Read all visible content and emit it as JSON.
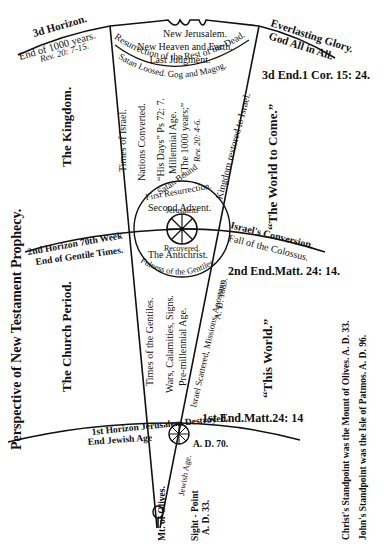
{
  "title": "Perspective of New Testament Prophecy.",
  "side_labels": {
    "kingdom": "The Kingdom.",
    "church_period": "The Church Period.",
    "world_to_come": "“The World to Come.”",
    "this_world": "“This World.”"
  },
  "top": {
    "new_jerusalem": "New Jerusalem.",
    "new_heaven": "New Heaven and Earth.",
    "last_judgment": "Last Judgment.",
    "resurrection": "Resurrection of the Rest of the Dead.",
    "satan_loosed": "Satan Loosed. Gog and Magog."
  },
  "third_horizon": {
    "title": "3d Horizon.",
    "line1": "End of 1000 years.",
    "line2": "Rev. 20: 7-15."
  },
  "everlasting": {
    "line1": "Everlasting Glory.",
    "line2": "God All in All."
  },
  "third_end": "3d End.1 Cor. 15: 24.",
  "kingdom_cone": {
    "times_of_israel": "Times of Israel.",
    "nations_converted": "Nations Converted.",
    "his_days": "“His Days” Ps 72: 7.",
    "millennial_age": "Millennial Age.",
    "thousand_years": "“The 1000 years;”",
    "rev_20": "Rev. 20: 4-6.",
    "kingdom_restored": "Kingdom restored to Israel.",
    "satan_bound": "Satan Bound",
    "first_resurrection": "First Resurrection."
  },
  "center": {
    "second_advent": "Second Advent.",
    "jerusalem": "Jerusalem",
    "recovered": "Recovered.",
    "antichrist": "The Antichrist.",
    "fulness": "Fulness of the Gentiles."
  },
  "second_horizon": {
    "line1": "2nd Horizon 70th Week",
    "line2": "End of Gentile Times."
  },
  "israels_conversion": {
    "line1": "Israel's Conversion.",
    "line2": "Fall of the Colossus."
  },
  "second_end": "2nd End.Matt. 24: 14.",
  "church_cone": {
    "times_of_gentiles": "Times of the Gentiles.",
    "wars": "Wars, Calamities, Signs.",
    "premillennial": "Pre-millennial Age.",
    "israel_scattered": "Israel Scattered, Missions, Apostasy.",
    "ad_1889": "A. D. 1889."
  },
  "first_horizon": {
    "line1": "1st Horizon Jerusalem Destroyed.",
    "line2": "End Jewish Age",
    "ad70": "A. D. 70."
  },
  "first_end": "1st End.Matt.24: 14",
  "bottom": {
    "jewish_age": "Jewish Age.",
    "mt_olives": "Mt. of Olives.",
    "sight_point": "Sight - Point",
    "ad33": "A. D. 33."
  },
  "standpoints": {
    "christ": "Christ's Standpoint was the Mount of Olives. A. D. 33.",
    "john": "John's Standpoint was the Isle of Patmos. A. D. 96."
  }
}
